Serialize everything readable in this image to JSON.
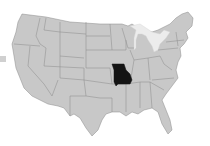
{
  "map": {
    "title": "United States map with Missouri highlighted",
    "region": "Contiguous United States",
    "highlighted_state": "Missouri",
    "colors": {
      "state_fill": "#c8c8c8",
      "state_border": "#8a8a8a",
      "highlight_fill": "#141414",
      "lakes": "#ececec",
      "background": "#ffffff"
    }
  }
}
